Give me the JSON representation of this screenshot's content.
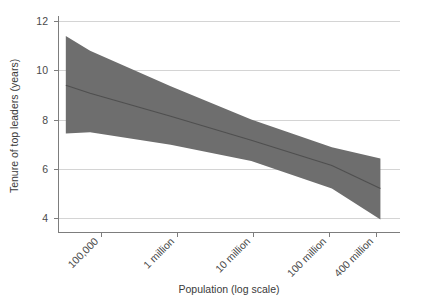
{
  "chart_data": {
    "type": "area",
    "title": "",
    "subtitle": "",
    "xlabel": "Population (log scale)",
    "ylabel": "Tenure of top leaders (years)",
    "x_scale": "log",
    "grid": true,
    "legend": null,
    "xlim": [
      40000,
      700000000
    ],
    "ylim": [
      3.2,
      12.4
    ],
    "yticks": [
      4,
      6,
      8,
      10,
      12
    ],
    "ytick_labels": [
      "4",
      "6",
      "8",
      "10",
      "12"
    ],
    "xticks": [
      100000,
      1000000,
      10000000,
      100000000,
      400000000
    ],
    "xtick_labels": [
      "100,000",
      "1 million",
      "10 million",
      "100 million",
      "400 million"
    ],
    "xtick_rotation": -45,
    "series": [
      {
        "name": "Fitted trend",
        "type": "line",
        "color": "#4f4f4f",
        "x": [
          50000,
          100000,
          1000000,
          10000000,
          100000000,
          400000000
        ],
        "values": [
          9.6,
          9.25,
          8.25,
          7.2,
          6.1,
          5.1
        ]
      },
      {
        "name": "Confidence band upper",
        "type": "band-upper",
        "color": "#6e6e6e",
        "x": [
          50000,
          100000,
          1000000,
          10000000,
          100000000,
          400000000
        ],
        "values": [
          11.75,
          11.1,
          9.55,
          8.1,
          6.9,
          6.4
        ]
      },
      {
        "name": "Confidence band lower",
        "type": "band-lower",
        "color": "#6e6e6e",
        "x": [
          50000,
          100000,
          1000000,
          10000000,
          100000000,
          400000000
        ],
        "values": [
          7.5,
          7.55,
          7.0,
          6.3,
          5.1,
          3.75
        ]
      }
    ],
    "band_fill_color": "#6e6e6e",
    "band_opacity": 1,
    "line_color": "#4f4f4f",
    "grid_color": "#cfcfcf",
    "axis_color": "#7d7d7d",
    "background_color": "#ffffff"
  },
  "axes": {
    "y_title": "Tenure of top leaders (years)",
    "x_title": "Population (log scale)",
    "y_tick_0": "4",
    "y_tick_1": "6",
    "y_tick_2": "8",
    "y_tick_3": "10",
    "y_tick_4": "12",
    "x_tick_0": "100,000",
    "x_tick_1": "1 million",
    "x_tick_2": "10 million",
    "x_tick_3": "100 million",
    "x_tick_4": "400 million"
  }
}
